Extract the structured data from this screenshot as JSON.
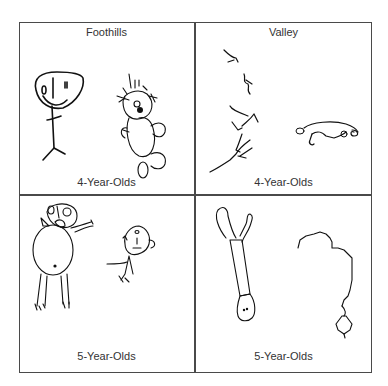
{
  "figure": {
    "panels": [
      {
        "id": "top-left",
        "title": "Foothills",
        "caption": "4-Year-Olds",
        "drawings": [
          "stick-figure-person",
          "teddy-bear-like-figure"
        ]
      },
      {
        "id": "top-right",
        "title": "Valley",
        "caption": "4-Year-Olds",
        "drawings": [
          "fragmented-scribble-figure",
          "horizontal-animal-figure"
        ]
      },
      {
        "id": "bottom-left",
        "title": "",
        "caption": "5-Year-Olds",
        "drawings": [
          "round-body-person",
          "small-stick-figure"
        ]
      },
      {
        "id": "bottom-right",
        "title": "",
        "caption": "5-Year-Olds",
        "drawings": [
          "elongated-figure",
          "jagged-outline-figure"
        ]
      }
    ],
    "colors": {
      "stroke": "#111111",
      "frame": "#4a4a4a",
      "text": "#333333",
      "background": "#ffffff"
    }
  }
}
